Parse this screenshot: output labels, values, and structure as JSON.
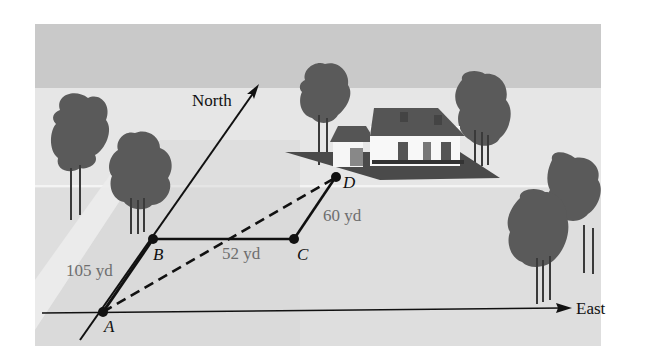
{
  "diagram": {
    "type": "vector-displacement-scene",
    "axes": {
      "north_label": "North",
      "east_label": "East"
    },
    "points": [
      {
        "id": "A",
        "label": "A"
      },
      {
        "id": "B",
        "label": "B"
      },
      {
        "id": "C",
        "label": "C"
      },
      {
        "id": "D",
        "label": "D"
      }
    ],
    "segments": [
      {
        "from": "A",
        "to": "B",
        "label": "105 yd",
        "style": "solid"
      },
      {
        "from": "B",
        "to": "C",
        "label": "52 yd",
        "style": "solid"
      },
      {
        "from": "C",
        "to": "D",
        "label": "60 yd",
        "style": "solid"
      },
      {
        "from": "A",
        "to": "D",
        "label": "",
        "style": "dashed"
      }
    ],
    "scenery": [
      "sky",
      "ground",
      "house",
      "trees"
    ],
    "colors": {
      "sky": "#c9c9c9",
      "ground": "#dcdcdc",
      "tree": "#585858",
      "line": "#111111",
      "distance_text": "#6e6e6e"
    }
  }
}
